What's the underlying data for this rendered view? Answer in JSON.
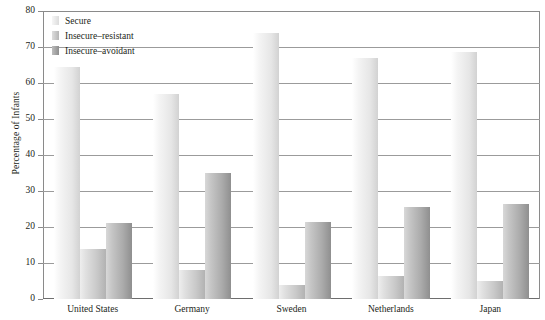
{
  "chart_data": {
    "type": "bar",
    "title": "",
    "xlabel": "",
    "ylabel": "Percentage of Infants",
    "ylim": [
      0,
      80
    ],
    "ytick_step": 10,
    "yticks": [
      0,
      10,
      20,
      30,
      40,
      50,
      60,
      70,
      80
    ],
    "grid": true,
    "legend_position": "top-left",
    "categories": [
      "United States",
      "Germany",
      "Sweden",
      "Netherlands",
      "Japan"
    ],
    "series": [
      {
        "name": "Secure",
        "color": "#e6e6e6",
        "values": [
          64.5,
          57,
          74,
          67,
          68.5
        ]
      },
      {
        "name": "Insecure–resistant",
        "color": "#c9c9c9",
        "values": [
          14,
          8,
          4,
          6.5,
          5
        ]
      },
      {
        "name": "Insecure–avoidant",
        "color": "#ababab",
        "values": [
          21,
          35,
          21.5,
          25.5,
          26.5
        ]
      }
    ]
  },
  "legend": {
    "items": [
      {
        "label": "Secure",
        "swatch": "legend-swatch-secure"
      },
      {
        "label": "Insecure–resistant",
        "swatch": "legend-swatch-resistant"
      },
      {
        "label": "Insecure–avoidant",
        "swatch": "legend-swatch-avoidant"
      }
    ]
  },
  "axis": {
    "y_title": "Percentage of Infants",
    "y_labels": [
      "80",
      "70",
      "60",
      "50",
      "40",
      "30",
      "20",
      "10",
      "0"
    ],
    "x_labels": [
      "United States",
      "Germany",
      "Sweden",
      "Netherlands",
      "Japan"
    ]
  }
}
